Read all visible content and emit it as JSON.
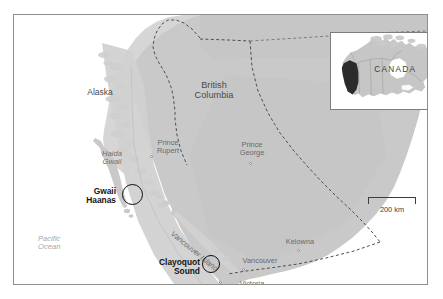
{
  "figure": {
    "kind": "reference-map",
    "title_visible": false
  },
  "colors": {
    "land": "#c9c9c9",
    "land_shadow": "#b6b6b6",
    "coast_relief": "#d8d8d8",
    "water": "#ffffff",
    "frame": "#8f8f8f",
    "border_dash": "#5a5a5a",
    "label_dark": "#4a4a4a",
    "label_muted": "#6e6e6e",
    "ocean_label": "#a9a9a9",
    "park_marker": "#0d0d0d",
    "inset_highlight": "#2b2b2b",
    "inset_land": "#c4c4c4"
  },
  "regions": [
    {
      "id": "alaska",
      "label": "Alaska",
      "x": 86,
      "y": 78,
      "style": "region"
    },
    {
      "id": "british-columbia",
      "label": "British\nColumbia",
      "x": 200,
      "y": 75,
      "style": "region-big"
    }
  ],
  "islands": [
    {
      "id": "haida-gwaii",
      "label": "Haida\nGwaii",
      "x": 98,
      "y": 142
    },
    {
      "id": "vancouver-island",
      "label": "Vancouver Island",
      "x": 183,
      "y": 223,
      "rotation_deg": 39
    }
  ],
  "ocean": {
    "label": "Pacific\nOcean",
    "x": 37,
    "y": 228
  },
  "cities": [
    {
      "id": "prince-rupert",
      "label": "Prince\nRupert",
      "label_x": 154,
      "label_y": 133,
      "dot_x": 151,
      "dot_y": 150
    },
    {
      "id": "prince-george",
      "label": "Prince\nGeorge",
      "label_x": 249,
      "label_y": 135,
      "dot_x": 249,
      "dot_y": 156
    },
    {
      "id": "kelowna",
      "label": "Kelowna",
      "label_x": 298,
      "label_y": 232,
      "dot_x": 296,
      "dot_y": 244
    },
    {
      "id": "vancouver",
      "label": "Vancouver",
      "label_x": 250,
      "label_y": 251,
      "dot_x": 242,
      "dot_y": 262
    },
    {
      "id": "victoria",
      "label": "Victoria",
      "label_x": 238,
      "label_y": 274,
      "dot_x": 225,
      "dot_y": 275
    }
  ],
  "parks": [
    {
      "id": "gwaii-haanas",
      "label": "Gwaii\nHaanas",
      "label_x": 59,
      "label_y": 184,
      "circle_x": 125,
      "circle_y": 184,
      "circle_d": 21
    },
    {
      "id": "clayoquot-sound",
      "label": "Clayoquot\nSound",
      "label_x": 144,
      "label_y": 254,
      "circle_x": 204,
      "circle_y": 257,
      "circle_d": 17
    }
  ],
  "scale_bar": {
    "label": "200 km",
    "length_px": 48,
    "distance_value": 200,
    "distance_unit": "km"
  },
  "inset": {
    "label": "CANADA",
    "label_x": 44,
    "label_y": 37,
    "highlighted_region": "British Columbia",
    "country": "Canada"
  },
  "boundaries": [
    {
      "id": "alaska-bc-border",
      "type": "international",
      "style": "dashed"
    },
    {
      "id": "sixtieth-parallel",
      "type": "territorial",
      "style": "dashed"
    },
    {
      "id": "bc-alberta-border",
      "type": "provincial",
      "style": "dashed"
    },
    {
      "id": "canada-usa-49th",
      "type": "international",
      "style": "dashed"
    }
  ]
}
